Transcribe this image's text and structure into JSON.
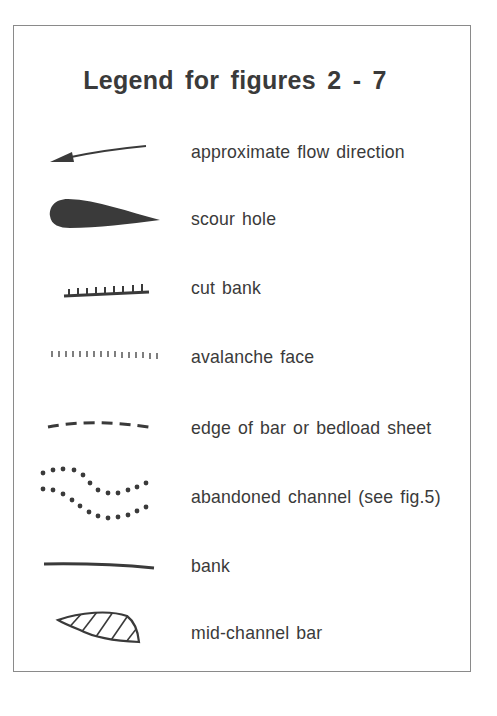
{
  "legend": {
    "title": "Legend for figures 2 - 7",
    "items": [
      {
        "symbol": "arrow-icon",
        "label": "approximate flow direction"
      },
      {
        "symbol": "teardrop-filled-icon",
        "label": "scour hole"
      },
      {
        "symbol": "ticked-line-icon",
        "label": "cut bank"
      },
      {
        "symbol": "tick-row-icon",
        "label": "avalanche face"
      },
      {
        "symbol": "dashed-line-icon",
        "label": "edge of bar or bedload sheet"
      },
      {
        "symbol": "dotted-wavy-lines-icon",
        "label": "abandoned channel (see fig.5)"
      },
      {
        "symbol": "solid-line-icon",
        "label": "bank"
      },
      {
        "symbol": "hatched-lens-icon",
        "label": "mid-channel bar"
      }
    ]
  },
  "colors": {
    "ink": "#3a3a3a",
    "frame": "#8a8a8a",
    "background": "#ffffff"
  }
}
